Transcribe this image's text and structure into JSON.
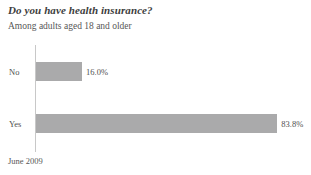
{
  "chart_data": {
    "type": "bar",
    "orientation": "horizontal",
    "title": "Do you have health insurance?",
    "subtitle": "Among adults aged 18 and older",
    "footer": "June 2009",
    "xlabel": "",
    "ylabel": "",
    "xlim": [
      0,
      100
    ],
    "grid": false,
    "legend": false,
    "bar_color": "#aaaaab",
    "axis_color": "#c8c8c8",
    "categories": [
      "No",
      "Yes"
    ],
    "values": [
      16.0,
      83.8
    ],
    "value_labels": [
      "16.0%",
      "83.8%"
    ],
    "bars": [
      {
        "category": "No",
        "value": 16.0,
        "value_label": "16.0%"
      },
      {
        "category": "Yes",
        "value": 83.8,
        "value_label": "83.8%"
      }
    ]
  }
}
